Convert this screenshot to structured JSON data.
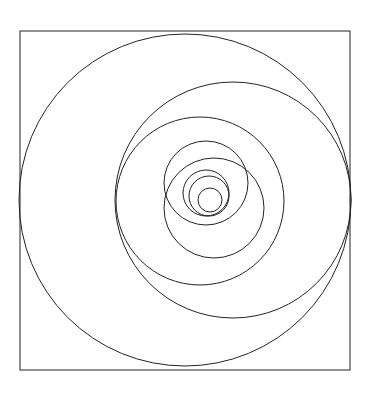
{
  "diagram": {
    "title": "",
    "stroke_color": "#222222",
    "background": "#ffffff",
    "frame": {
      "x": 20,
      "y": 31,
      "width": 330,
      "height": 339
    },
    "circles": [
      {
        "cx": 185,
        "cy": 200,
        "r": 166
      },
      {
        "cx": 233,
        "cy": 200,
        "r": 118
      },
      {
        "cx": 200,
        "cy": 201,
        "r": 84
      },
      {
        "cx": 206,
        "cy": 183,
        "r": 42
      },
      {
        "cx": 214,
        "cy": 208,
        "r": 50
      },
      {
        "cx": 206,
        "cy": 193,
        "r": 23
      },
      {
        "cx": 209,
        "cy": 196,
        "r": 20
      },
      {
        "cx": 210,
        "cy": 200,
        "r": 12
      }
    ]
  }
}
